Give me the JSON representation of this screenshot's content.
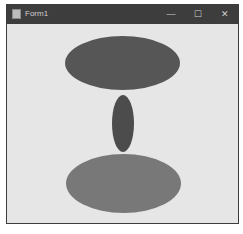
{
  "window": {
    "title": "Form1",
    "controls": {
      "minimize": "—",
      "maximize": "☐",
      "close": "✕"
    }
  },
  "canvas": {
    "background": "#e6e6e6",
    "shapes": [
      {
        "name": "top-ellipse",
        "type": "ellipse",
        "x": 58,
        "y": 12,
        "width": 115,
        "height": 54,
        "color": "#565656"
      },
      {
        "name": "middle-ellipse",
        "type": "ellipse",
        "x": 105,
        "y": 71,
        "width": 22,
        "height": 57,
        "color": "#4c4c4c"
      },
      {
        "name": "bottom-ellipse",
        "type": "ellipse",
        "x": 59,
        "y": 130,
        "width": 115,
        "height": 59,
        "color": "#787878"
      }
    ]
  }
}
